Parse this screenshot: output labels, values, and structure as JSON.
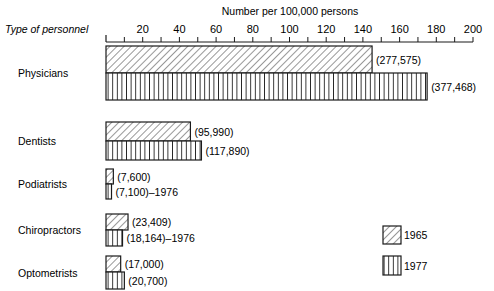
{
  "chart_data": {
    "type": "bar",
    "orientation": "horizontal",
    "title": "",
    "xlabel": "Number per 100,000 persons",
    "ylabel": "Type of personnel",
    "xlim": [
      0,
      200
    ],
    "xticks": [
      20,
      40,
      60,
      80,
      100,
      120,
      140,
      160,
      180,
      200
    ],
    "minor_tick_step": 10,
    "grid": false,
    "legend_position": "bottom-right",
    "categories": [
      "Physicians",
      "Dentists",
      "Podiatrists",
      "Chiropractors",
      "Optometrists"
    ],
    "series": [
      {
        "name": "1965",
        "pattern": "diagonal-hatch",
        "values": [
          145,
          46,
          4,
          12,
          8
        ],
        "labels": [
          "(277,575)",
          "(95,990)",
          "(7,600)",
          "(23,409)",
          "(17,000)"
        ]
      },
      {
        "name": "1977",
        "pattern": "vertical-hatch",
        "values": [
          175,
          52,
          3,
          9,
          10
        ],
        "labels": [
          "(377,468)",
          "(117,890)",
          "(7,100)–1976",
          "(18,164)–1976",
          "(20,700)"
        ]
      }
    ]
  },
  "colors": {
    "ink": "#1a1a1a",
    "background": "#ffffff"
  }
}
